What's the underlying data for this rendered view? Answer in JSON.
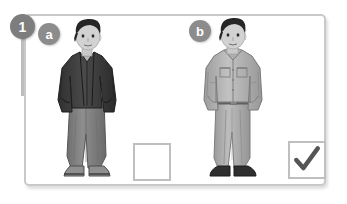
{
  "exercise": {
    "number": "1",
    "options": [
      {
        "letter": "a",
        "description": "Man wearing a dark zip-up casual jacket over a light ribbed sweater, grey jeans and grey sneakers, hands in pockets",
        "selected": false,
        "checkbox_state": "unchecked"
      },
      {
        "letter": "b",
        "description": "Man wearing a light grey button-up shirt jacket with chest pockets, light grey trousers and dark dress shoes, hands in pockets",
        "selected": true,
        "checkbox_state": "checked"
      }
    ],
    "check_glyph": "✓"
  },
  "colors": {
    "frame_border": "#c9c9c9",
    "marker_circle": "#7d7d7d",
    "badge_circle": "#8c8c8c",
    "checkbox_border": "#bfbfbf",
    "check_mark": "#555555",
    "page_background": "#ffffff",
    "figure_dark": "#3a3a3a",
    "figure_mid": "#8a8a8a",
    "figure_light": "#c4c4c4"
  }
}
